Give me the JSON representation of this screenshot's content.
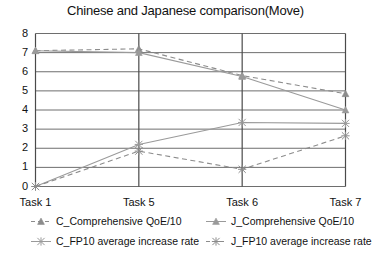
{
  "chart_data": {
    "type": "line",
    "title": "Chinese and Japanese comparison(Move)",
    "xlabel": "",
    "ylabel": "",
    "categories": [
      "Task 1",
      "Task 5",
      "Task 6",
      "Task 7"
    ],
    "ylim": [
      0,
      8
    ],
    "yticks": [
      0,
      1,
      2,
      3,
      4,
      5,
      6,
      7,
      8
    ],
    "grid": true,
    "legend_position": "bottom",
    "series": [
      {
        "name": "C_Comprehensive QoE/10",
        "values": [
          7.1,
          7.2,
          5.8,
          4.85
        ],
        "style": "dashed",
        "marker": "triangle",
        "color": "#8c8c8c"
      },
      {
        "name": "J_Comprehensive QoE/10",
        "values": [
          7.1,
          7.0,
          5.75,
          4.0
        ],
        "style": "solid",
        "marker": "triangle",
        "color": "#9a9a9a"
      },
      {
        "name": "C_FP10 average increase rate",
        "values": [
          0.0,
          2.2,
          3.35,
          3.3
        ],
        "style": "solid",
        "marker": "star",
        "color": "#9a9a9a"
      },
      {
        "name": "J_FP10 average increase rate",
        "values": [
          0.0,
          1.85,
          0.9,
          2.65
        ],
        "style": "dashed",
        "marker": "star",
        "color": "#8c8c8c"
      }
    ]
  },
  "legend": {
    "items": [
      "C_Comprehensive QoE/10",
      "J_Comprehensive QoE/10",
      "C_FP10 average increase rate",
      "J_FP10 average increase rate"
    ]
  },
  "colors": {
    "axis": "#4a4a4a",
    "grid": "#6e6e6e",
    "series_solid": "#9a9a9a",
    "series_dashed": "#8c8c8c",
    "text": "#111111",
    "background": "#ffffff"
  }
}
